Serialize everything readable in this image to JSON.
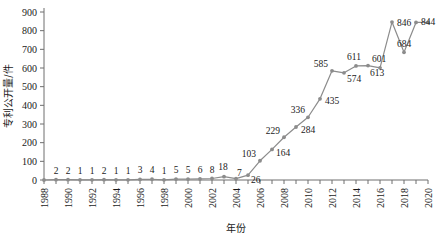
{
  "chart_data": {
    "type": "line",
    "title": "",
    "xlabel": "年份",
    "ylabel": "专利公开量/件",
    "ylim": [
      0,
      900
    ],
    "ytick_step": 100,
    "yticks": [
      0,
      100,
      200,
      300,
      400,
      500,
      600,
      700,
      800,
      900
    ],
    "xlim": [
      1988,
      2020
    ],
    "xticks_labeled": [
      1988,
      1990,
      1992,
      1994,
      1996,
      1998,
      2000,
      2002,
      2004,
      2006,
      2008,
      2010,
      2012,
      2014,
      2016,
      2018,
      2020
    ],
    "xtick_minor_every": 1,
    "grid": false,
    "legend": false,
    "series_color": "#8c8c8c",
    "marker": "circle",
    "show_data_labels": true,
    "categories": [
      1988,
      1989,
      1990,
      1991,
      1992,
      1993,
      1994,
      1995,
      1996,
      1997,
      1998,
      1999,
      2000,
      2001,
      2002,
      2003,
      2004,
      2005,
      2006,
      2007,
      2008,
      2009,
      2010,
      2011,
      2012,
      2013,
      2014,
      2015,
      2016,
      2017,
      2018,
      2019,
      2020
    ],
    "values": [
      0,
      2,
      2,
      1,
      1,
      2,
      1,
      1,
      3,
      4,
      1,
      5,
      5,
      6,
      8,
      18,
      7,
      26,
      103,
      164,
      229,
      284,
      336,
      435,
      585,
      574,
      611,
      613,
      601,
      846,
      684,
      844,
      844
    ],
    "series": [
      {
        "name": "专利公开量",
        "values": [
          0,
          2,
          2,
          1,
          1,
          2,
          1,
          1,
          3,
          4,
          1,
          5,
          5,
          6,
          8,
          18,
          7,
          26,
          103,
          164,
          229,
          284,
          336,
          435,
          585,
          574,
          611,
          613,
          601,
          846,
          684,
          844,
          844
        ]
      }
    ],
    "point_labels": [
      "",
      "2",
      "2",
      "1",
      "1",
      "2",
      "1",
      "1",
      "3",
      "4",
      "1",
      "5",
      "5",
      "6",
      "8",
      "18",
      "7",
      "26",
      "103",
      "164",
      "229",
      "284",
      "336",
      "435",
      "585",
      "574",
      "611",
      "613",
      "601",
      "846",
      "684",
      "844",
      ""
    ]
  }
}
